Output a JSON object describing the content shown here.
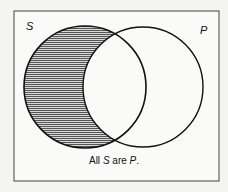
{
  "diagram": {
    "type": "venn",
    "sets": [
      {
        "id": "S",
        "label": "S",
        "shaded_region": "S minus P"
      },
      {
        "id": "P",
        "label": "P"
      }
    ],
    "caption": {
      "prefix": "All ",
      "subject": "S",
      "middle": " are ",
      "predicate": "P",
      "suffix": "."
    },
    "colors": {
      "background": "#f4f4f2",
      "line": "#111111",
      "hatch": "#333333"
    }
  }
}
